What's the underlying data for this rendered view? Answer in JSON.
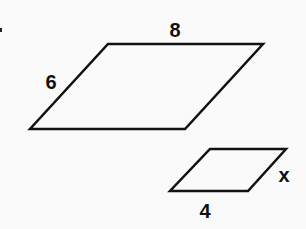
{
  "diagram": {
    "large_parallelogram": {
      "points": "108,44 263,44 185,129 30,129",
      "top_label": "8",
      "left_label": "6"
    },
    "small_parallelogram": {
      "points": "210,149 286,149 248,191 170,191",
      "bottom_label": "4",
      "right_label": "x"
    },
    "stroke_color": "#111111",
    "background_color": "#fafafa"
  }
}
